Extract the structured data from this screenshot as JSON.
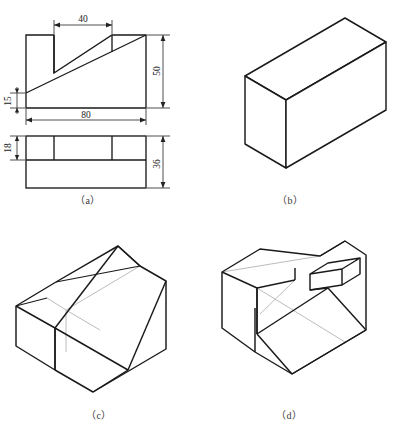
{
  "page": {
    "top_strip_text": "",
    "background_color": "#ffffff",
    "line_color": "#1a1a1a",
    "hidden_line_color": "#b9b9b9"
  },
  "captions": {
    "a": "（a）",
    "b": "（b）",
    "c": "（c）",
    "d": "（d）"
  },
  "orthographic": {
    "label": "two-view orthographic projection",
    "front_view": {
      "name": "front-view",
      "dimensions": [
        {
          "value": "40",
          "orientation": "horizontal",
          "location": "top"
        },
        {
          "value": "50",
          "orientation": "vertical",
          "location": "right"
        },
        {
          "value": "15",
          "orientation": "vertical",
          "location": "left"
        },
        {
          "value": "80",
          "orientation": "horizontal",
          "location": "bottom"
        }
      ]
    },
    "top_view": {
      "name": "top-view",
      "dimensions": [
        {
          "value": "18",
          "orientation": "vertical",
          "location": "left"
        },
        {
          "value": "36",
          "orientation": "vertical",
          "location": "right"
        }
      ]
    }
  },
  "choices": [
    {
      "key": "b",
      "name": "isometric-choice-b",
      "description": "plain rectangular block"
    },
    {
      "key": "c",
      "name": "isometric-choice-c",
      "description": "wedge block with inclined slot"
    },
    {
      "key": "d",
      "name": "isometric-choice-d",
      "description": "wedge block with rectangular slot through raised ribs"
    }
  ],
  "dimension_values": {
    "d40": "40",
    "d50": "50",
    "d15": "15",
    "d80": "80",
    "d18": "18",
    "d36": "36"
  }
}
